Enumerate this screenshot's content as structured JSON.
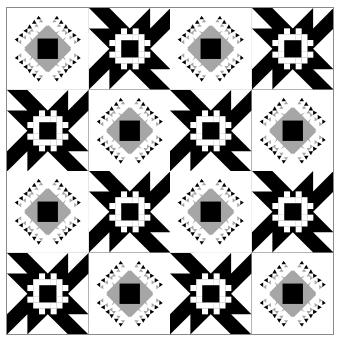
{
  "colors": {
    "black": "#000000",
    "white": "#ffffff",
    "gray": "#a6a6a6",
    "border": "#8a8a8a"
  },
  "grid": {
    "rows": 4,
    "cols": 4,
    "layout": [
      [
        "gray-star",
        "black-star",
        "gray-star",
        "black-star"
      ],
      [
        "black-star",
        "gray-star",
        "black-star",
        "gray-star"
      ],
      [
        "gray-star",
        "black-star",
        "gray-star",
        "black-star"
      ],
      [
        "black-star",
        "gray-star",
        "black-star",
        "gray-star"
      ]
    ]
  },
  "blocks": {
    "black-star": {
      "description": "Black eight-point star with white nine-patch ring center",
      "center_pattern": [
        "0010100",
        "0111110",
        "1100011",
        "0100010",
        "1100011",
        "0111110",
        "0010100"
      ]
    },
    "gray-star": {
      "description": "Sawtooth star with gray diamond and black square center"
    }
  }
}
